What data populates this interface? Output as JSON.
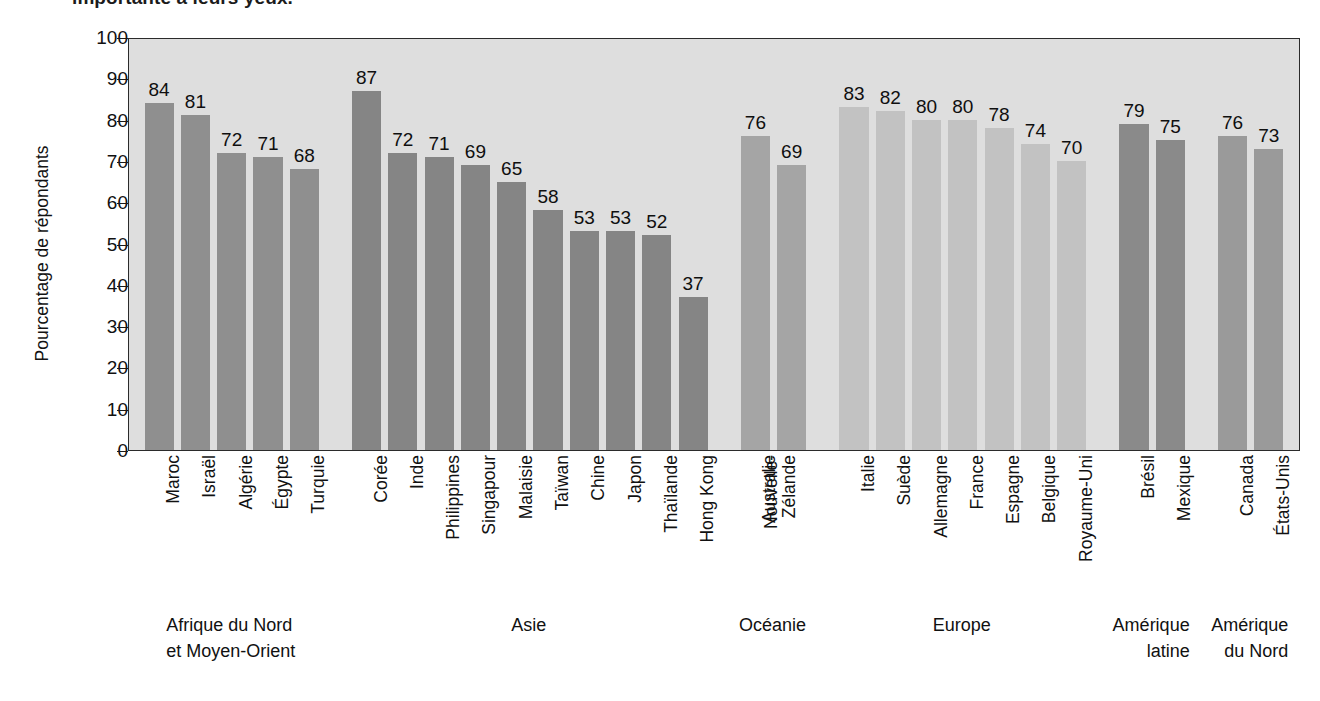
{
  "caption": {
    "text": "importante à leurs yeux."
  },
  "chart_data": {
    "type": "bar",
    "title": "",
    "xlabel": "",
    "ylabel": "Pourcentage de répondants",
    "ylim": [
      0,
      100
    ],
    "ytick_step": 10,
    "yticks": [
      100,
      90,
      80,
      70,
      60,
      50,
      40,
      30,
      20,
      10,
      0
    ],
    "grid": false,
    "legend": "none",
    "value_labels": true,
    "categories": [
      "Maroc",
      "Israël",
      "Algérie",
      "Égypte",
      "Turquie",
      "Corée",
      "Inde",
      "Philippines",
      "Singapour",
      "Malaisie",
      "Taïwan",
      "Chine",
      "Japon",
      "Thaïlande",
      "Hong Kong",
      "Australie",
      "Nouvelle-Zélande",
      "Italie",
      "Suède",
      "Allemagne",
      "France",
      "Espagne",
      "Belgique",
      "Royaume-Uni",
      "Brésil",
      "Mexique",
      "Canada",
      "États-Unis"
    ],
    "values": [
      84,
      81,
      72,
      71,
      68,
      87,
      72,
      71,
      69,
      65,
      58,
      53,
      53,
      52,
      37,
      76,
      69,
      83,
      82,
      80,
      80,
      78,
      74,
      70,
      79,
      75,
      76,
      73
    ],
    "groups": [
      {
        "name": "Afrique du Nord et Moyen-Orient",
        "line1": "Afrique du Nord",
        "line2": "et Moyen-Orient",
        "color": "#8f8f8f",
        "count": 5
      },
      {
        "name": "Asie",
        "line1": "Asie",
        "line2": "",
        "color": "#858585",
        "count": 10
      },
      {
        "name": "Océanie",
        "line1": "Océanie",
        "line2": "",
        "color": "#a5a5a5",
        "count": 2
      },
      {
        "name": "Europe",
        "line1": "Europe",
        "line2": "",
        "color": "#c2c2c2",
        "count": 7
      },
      {
        "name": "Amérique latine",
        "line1": "Amérique",
        "line2": "latine",
        "color": "#8a8a8a",
        "count": 2
      },
      {
        "name": "Amérique du Nord",
        "line1": "Amérique",
        "line2": "du Nord",
        "color": "#9a9a9a",
        "count": 2
      }
    ]
  },
  "country_labels": [
    {
      "text": "Maroc",
      "line2": ""
    },
    {
      "text": "Israël",
      "line2": ""
    },
    {
      "text": "Algérie",
      "line2": ""
    },
    {
      "text": "Égypte",
      "line2": ""
    },
    {
      "text": "Turquie",
      "line2": ""
    },
    {
      "text": "Corée",
      "line2": ""
    },
    {
      "text": "Inde",
      "line2": ""
    },
    {
      "text": "Philippines",
      "line2": ""
    },
    {
      "text": "Singapour",
      "line2": ""
    },
    {
      "text": "Malaisie",
      "line2": ""
    },
    {
      "text": "Taïwan",
      "line2": ""
    },
    {
      "text": "Chine",
      "line2": ""
    },
    {
      "text": "Japon",
      "line2": ""
    },
    {
      "text": "Thaïlande",
      "line2": ""
    },
    {
      "text": "Hong Kong",
      "line2": ""
    },
    {
      "text": "Australie",
      "line2": ""
    },
    {
      "text": "Nouvelle-",
      "line2": "Zélande"
    },
    {
      "text": "Italie",
      "line2": ""
    },
    {
      "text": "Suède",
      "line2": ""
    },
    {
      "text": "Allemagne",
      "line2": ""
    },
    {
      "text": "France",
      "line2": ""
    },
    {
      "text": "Espagne",
      "line2": ""
    },
    {
      "text": "Belgique",
      "line2": ""
    },
    {
      "text": "Royaume-Uni",
      "line2": ""
    },
    {
      "text": "Brésil",
      "line2": ""
    },
    {
      "text": "Mexique",
      "line2": ""
    },
    {
      "text": "Canada",
      "line2": ""
    },
    {
      "text": "États-Unis",
      "line2": ""
    }
  ],
  "colors": {
    "plot_background": "#dedede",
    "axis": "#2b2b2b",
    "text": "#111111"
  }
}
